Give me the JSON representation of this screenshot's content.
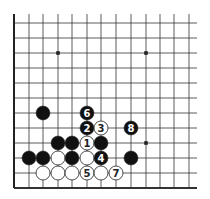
{
  "diagram": {
    "type": "go-board-partial",
    "colors": {
      "line": "#333333",
      "edge": "#222222",
      "black": "#111111",
      "white": "#ffffff",
      "background": "#ffffff"
    },
    "grid": {
      "columns_x": [
        14,
        29,
        43,
        58,
        72,
        87,
        101,
        116,
        131,
        146,
        160,
        174,
        189
      ],
      "rows_y": [
        23,
        38,
        53,
        68,
        83,
        98,
        113,
        128,
        143,
        158,
        173,
        188
      ],
      "line_extend_right": 197,
      "line_extend_top": 14,
      "left_edge": true,
      "bottom_edge": true
    },
    "star_points": [
      {
        "col": 3,
        "row": 2
      },
      {
        "col": 9,
        "row": 2
      },
      {
        "col": 9,
        "row": 8
      }
    ],
    "stones": [
      {
        "col": 2,
        "row": 6,
        "color": "black",
        "label": ""
      },
      {
        "col": 5,
        "row": 6,
        "color": "black",
        "label": "6"
      },
      {
        "col": 5,
        "row": 7,
        "color": "black",
        "label": "2"
      },
      {
        "col": 6,
        "row": 7,
        "color": "white",
        "label": "3"
      },
      {
        "col": 8,
        "row": 7,
        "color": "black",
        "label": "8"
      },
      {
        "col": 3,
        "row": 8,
        "color": "black",
        "label": ""
      },
      {
        "col": 4,
        "row": 8,
        "color": "black",
        "label": ""
      },
      {
        "col": 5,
        "row": 8,
        "color": "white",
        "label": "1"
      },
      {
        "col": 6,
        "row": 8,
        "color": "black",
        "label": ""
      },
      {
        "col": 1,
        "row": 9,
        "color": "black",
        "label": ""
      },
      {
        "col": 2,
        "row": 9,
        "color": "black",
        "label": ""
      },
      {
        "col": 3,
        "row": 9,
        "color": "white",
        "label": ""
      },
      {
        "col": 4,
        "row": 9,
        "color": "black",
        "label": ""
      },
      {
        "col": 5,
        "row": 9,
        "color": "white",
        "label": ""
      },
      {
        "col": 6,
        "row": 9,
        "color": "black",
        "label": "4"
      },
      {
        "col": 8,
        "row": 9,
        "color": "black",
        "label": ""
      },
      {
        "col": 2,
        "row": 10,
        "color": "white",
        "label": ""
      },
      {
        "col": 3,
        "row": 10,
        "color": "white",
        "label": ""
      },
      {
        "col": 4,
        "row": 10,
        "color": "white",
        "label": ""
      },
      {
        "col": 5,
        "row": 10,
        "color": "white",
        "label": "5"
      },
      {
        "col": 6,
        "row": 10,
        "color": "white",
        "label": ""
      },
      {
        "col": 7,
        "row": 10,
        "color": "white",
        "label": "7"
      }
    ]
  }
}
